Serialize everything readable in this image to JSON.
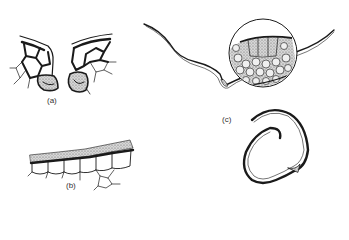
{
  "figure": {
    "panels": [
      {
        "id": "a",
        "label": "(a)",
        "description": "stomata cross-section, paired guard cells with surrounding epidermal cells"
      },
      {
        "id": "b",
        "label": "(b)",
        "description": "epidermis with cuticle layer over row of cells"
      },
      {
        "id": "c",
        "label": "(c)",
        "description": "leaf cross-section outline with magnified circular inset of cells, and rolled leaf section"
      }
    ]
  },
  "colors": {
    "ink": "#1a1a1a",
    "stipple": "#8a8a8a",
    "background": "#ffffff"
  }
}
